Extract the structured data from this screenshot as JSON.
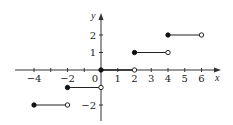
{
  "chart_data": {
    "type": "line",
    "title": "",
    "xlabel": "x",
    "ylabel": "y",
    "xlim": [
      -5.2,
      7.1
    ],
    "ylim": [
      -3.2,
      3.2
    ],
    "grid": false,
    "legend": null,
    "x_ticks": [
      -4,
      -3,
      -2,
      -1,
      1,
      2,
      3,
      4,
      5,
      6
    ],
    "x_tick_labels": [
      {
        "value": -4,
        "label": "−4"
      },
      {
        "value": -2,
        "label": "−2"
      },
      {
        "value": 0,
        "label": "0"
      },
      {
        "value": 1,
        "label": "1"
      },
      {
        "value": 2,
        "label": "2"
      },
      {
        "value": 3,
        "label": "3"
      },
      {
        "value": 4,
        "label": "4"
      },
      {
        "value": 5,
        "label": "5"
      },
      {
        "value": 6,
        "label": "6"
      }
    ],
    "y_ticks": [
      -2,
      -1,
      1,
      2
    ],
    "y_tick_labels": [
      {
        "value": 2,
        "label": "2"
      },
      {
        "value": 1,
        "label": "1"
      },
      {
        "value": -2,
        "label": "−2"
      }
    ],
    "series": [
      {
        "name": "step function",
        "segments": [
          {
            "x_start": -4,
            "x_end": -2,
            "y": -2,
            "start_closed": true,
            "end_closed": false
          },
          {
            "x_start": -2,
            "x_end": 0,
            "y": -1,
            "start_closed": true,
            "end_closed": false
          },
          {
            "x_start": 0,
            "x_end": 2,
            "y": 0,
            "start_closed": true,
            "end_closed": false
          },
          {
            "x_start": 2,
            "x_end": 4,
            "y": 1,
            "start_closed": true,
            "end_closed": false
          },
          {
            "x_start": 4,
            "x_end": 6,
            "y": 2,
            "start_closed": true,
            "end_closed": false
          }
        ]
      }
    ],
    "colors": {
      "axis": "#333333",
      "line": "#222222",
      "point": "#111111"
    }
  }
}
